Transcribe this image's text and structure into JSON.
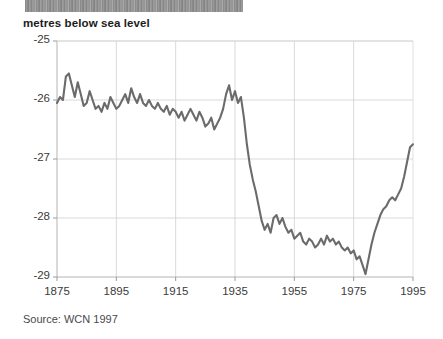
{
  "title_band": {
    "text": "",
    "note": "illegible scanned header strip"
  },
  "header": {
    "axis_title": "metres below sea level",
    "source": "Source: WCN 1997"
  },
  "chart_data": {
    "type": "line",
    "title": "metres below sea level",
    "subtitle": "",
    "xlabel": "",
    "ylabel": "metres below sea level",
    "xlim": [
      1875,
      1995
    ],
    "ylim": [
      -29,
      -25
    ],
    "xticks": [
      1875,
      1895,
      1915,
      1935,
      1955,
      1975,
      1995
    ],
    "yticks": [
      -25,
      -26,
      -27,
      -28,
      -29
    ],
    "grid": true,
    "legend": "none",
    "line_color": "#6b6b6b",
    "series": [
      {
        "name": "Dead Sea level",
        "x": [
          1875,
          1876,
          1877,
          1878,
          1879,
          1880,
          1881,
          1882,
          1883,
          1884,
          1885,
          1886,
          1887,
          1888,
          1889,
          1890,
          1891,
          1892,
          1893,
          1894,
          1895,
          1896,
          1897,
          1898,
          1899,
          1900,
          1901,
          1902,
          1903,
          1904,
          1905,
          1906,
          1907,
          1908,
          1909,
          1910,
          1911,
          1912,
          1913,
          1914,
          1915,
          1916,
          1917,
          1918,
          1919,
          1920,
          1921,
          1922,
          1923,
          1924,
          1925,
          1926,
          1927,
          1928,
          1929,
          1930,
          1931,
          1932,
          1933,
          1934,
          1935,
          1936,
          1937,
          1938,
          1939,
          1940,
          1941,
          1942,
          1943,
          1944,
          1945,
          1946,
          1947,
          1948,
          1949,
          1950,
          1951,
          1952,
          1953,
          1954,
          1955,
          1956,
          1957,
          1958,
          1959,
          1960,
          1961,
          1962,
          1963,
          1964,
          1965,
          1966,
          1967,
          1968,
          1969,
          1970,
          1971,
          1972,
          1973,
          1974,
          1975,
          1976,
          1977,
          1978,
          1979,
          1980,
          1981,
          1982,
          1983,
          1984,
          1985,
          1986,
          1987,
          1988,
          1989,
          1990,
          1991,
          1992,
          1993,
          1994,
          1995
        ],
        "values": [
          -26.05,
          -25.95,
          -26.0,
          -25.6,
          -25.55,
          -25.75,
          -25.95,
          -25.7,
          -25.9,
          -26.1,
          -26.05,
          -25.85,
          -26.0,
          -26.15,
          -26.1,
          -26.2,
          -26.05,
          -26.15,
          -25.95,
          -26.05,
          -26.15,
          -26.1,
          -26.0,
          -25.9,
          -26.05,
          -25.8,
          -25.95,
          -26.05,
          -25.9,
          -26.05,
          -26.1,
          -26.0,
          -26.1,
          -26.15,
          -26.05,
          -26.15,
          -26.2,
          -26.1,
          -26.25,
          -26.15,
          -26.2,
          -26.3,
          -26.2,
          -26.35,
          -26.25,
          -26.15,
          -26.25,
          -26.35,
          -26.2,
          -26.3,
          -26.45,
          -26.4,
          -26.3,
          -26.5,
          -26.4,
          -26.3,
          -26.15,
          -25.9,
          -25.75,
          -26.0,
          -25.85,
          -26.05,
          -25.95,
          -26.3,
          -26.75,
          -27.1,
          -27.35,
          -27.55,
          -27.8,
          -28.05,
          -28.2,
          -28.1,
          -28.25,
          -28.0,
          -27.95,
          -28.1,
          -28.0,
          -28.15,
          -28.25,
          -28.2,
          -28.35,
          -28.3,
          -28.25,
          -28.4,
          -28.45,
          -28.35,
          -28.4,
          -28.5,
          -28.45,
          -28.35,
          -28.45,
          -28.3,
          -28.4,
          -28.35,
          -28.45,
          -28.4,
          -28.5,
          -28.55,
          -28.5,
          -28.6,
          -28.55,
          -28.7,
          -28.65,
          -28.8,
          -28.95,
          -28.7,
          -28.45,
          -28.25,
          -28.1,
          -27.95,
          -27.85,
          -27.8,
          -27.7,
          -27.65,
          -27.7,
          -27.6,
          -27.5,
          -27.3,
          -27.05,
          -26.8,
          -26.75
        ]
      }
    ]
  },
  "axis_labels": {
    "y": [
      "-25",
      "-26",
      "-27",
      "-28",
      "-29"
    ],
    "x": [
      "1875",
      "1895",
      "1915",
      "1935",
      "1955",
      "1975",
      "1995"
    ]
  }
}
